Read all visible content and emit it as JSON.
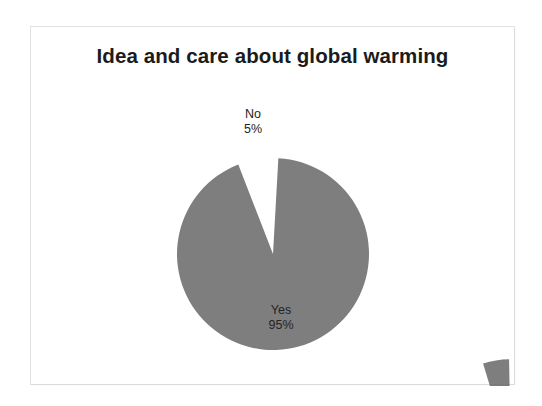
{
  "slide": {
    "background_color": "#ffffff",
    "frame_border_color": "#e2e2e2"
  },
  "chart": {
    "title": "Idea and care about global warming",
    "title_color": "#1b1b1b",
    "slice_color": "#7e7e7e",
    "label_color": "#242424"
  },
  "chart_data": {
    "type": "pie",
    "title": "Idea and care about global warming",
    "xlabel": "",
    "ylabel": "",
    "categories": [
      "Yes",
      "No"
    ],
    "values": [
      95,
      5
    ],
    "value_unit": "%",
    "labels": [
      {
        "name": "Yes",
        "value": "95%",
        "color": "#7e7e7e",
        "exploded": false
      },
      {
        "name": "No",
        "value": "5%",
        "color": "#7e7e7e",
        "exploded": true
      }
    ],
    "legend": false,
    "legend_position": "none",
    "grid": false,
    "data_labels_shown": true,
    "start_angle_deg": 0,
    "exploded_slice": "No"
  }
}
